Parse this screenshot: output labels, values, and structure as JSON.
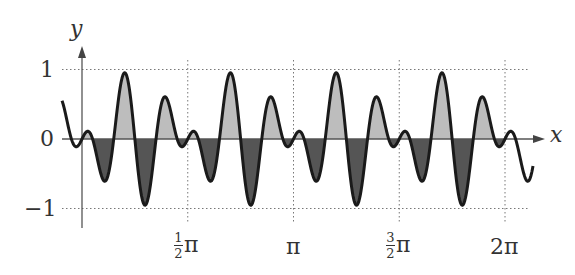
{
  "chart_data": {
    "type": "area",
    "title": "",
    "xlabel": "x",
    "ylabel": "y",
    "function": "f(x) = -sin(10(x - pi/4)) * cos(2(x - pi/4))",
    "xlim": [
      -0.3,
      2.15
    ],
    "xlim_units": "pi",
    "ylim": [
      -1,
      1
    ],
    "grid": "dotted",
    "xticks": [
      {
        "value": 0.5,
        "label_num": "1",
        "label_den": "2",
        "label_suffix": "π"
      },
      {
        "value": 1,
        "label": "π"
      },
      {
        "value": 1.5,
        "label_num": "3",
        "label_den": "2",
        "label_suffix": "π"
      },
      {
        "value": 2,
        "label": "2π"
      }
    ],
    "yticks": [
      {
        "value": 1,
        "label": "1"
      },
      {
        "value": 0,
        "label": "0"
      },
      {
        "value": -1,
        "label": "−1"
      }
    ],
    "fill_positive_color": "#bdbdbd",
    "fill_negative_color": "#555555",
    "line_color": "#1a1a1a",
    "extrema_per_period": [
      0.1,
      -0.6,
      1.0,
      -1.0,
      0.6,
      -0.1
    ],
    "period": "π/2"
  },
  "labels": {
    "y_axis": "y",
    "x_axis": "x",
    "y_one": "1",
    "y_zero": "0",
    "y_neg_one": "−1",
    "x_half_num": "1",
    "x_half_den": "2",
    "x_pi": "π",
    "x_threehalf_num": "3",
    "x_threehalf_den": "2",
    "x_two_pi": "2π"
  }
}
